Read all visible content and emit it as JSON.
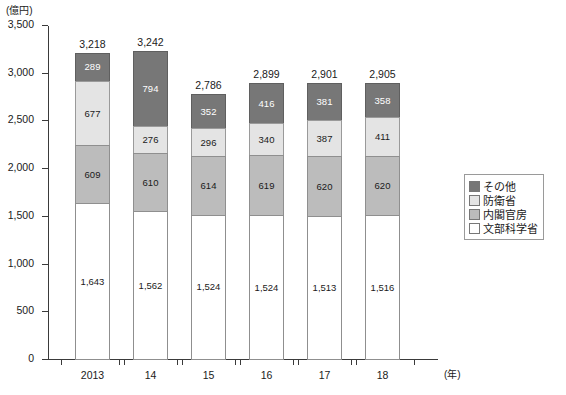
{
  "chart_data": {
    "type": "bar",
    "subtype": "stacked-bar",
    "title": "",
    "xlabel": "(年)",
    "ylabel": "(億円)",
    "ylim": [
      0,
      3500
    ],
    "ytick_values": [
      0,
      500,
      1000,
      1500,
      2000,
      2500,
      3000,
      3500
    ],
    "ytick_labels": [
      "0",
      "500",
      "1,000",
      "1,500",
      "2,000",
      "2,500",
      "3,000",
      "3,500"
    ],
    "grid": false,
    "legend_position": "right",
    "categories": [
      "2013",
      "14",
      "15",
      "16",
      "17",
      "18"
    ],
    "series": [
      {
        "name": "文部科学省",
        "color": "#ffffff",
        "values": [
          1643,
          1562,
          1524,
          1524,
          1513,
          1516
        ],
        "labels": [
          "1,643",
          "1,562",
          "1,524",
          "1,524",
          "1,513",
          "1,516"
        ]
      },
      {
        "name": "内閣官房",
        "color": "#bcbcbc",
        "values": [
          609,
          610,
          614,
          619,
          620,
          620
        ],
        "labels": [
          "609",
          "610",
          "614",
          "619",
          "620",
          "620"
        ]
      },
      {
        "name": "防衛省",
        "color": "#e4e4e4",
        "values": [
          677,
          276,
          296,
          340,
          387,
          411
        ],
        "labels": [
          "677",
          "276",
          "296",
          "340",
          "387",
          "411"
        ]
      },
      {
        "name": "その他",
        "color": "#777777",
        "values": [
          289,
          794,
          352,
          416,
          381,
          358
        ],
        "labels": [
          "289",
          "794",
          "352",
          "416",
          "381",
          "358"
        ]
      }
    ],
    "totals": [
      3218,
      3242,
      2786,
      2899,
      2901,
      2905
    ],
    "total_labels": [
      "3,218",
      "3,242",
      "2,786",
      "2,899",
      "2,901",
      "2,905"
    ]
  },
  "legend": {
    "items": [
      {
        "label": "その他",
        "color": "#777777"
      },
      {
        "label": "防衛省",
        "color": "#e4e4e4"
      },
      {
        "label": "内閣官房",
        "color": "#bcbcbc"
      },
      {
        "label": "文部科学省",
        "color": "#ffffff"
      }
    ]
  }
}
